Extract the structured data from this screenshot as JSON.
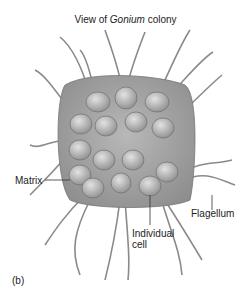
{
  "title": {
    "prefix": "View of ",
    "italic": "Gonium",
    "suffix": " colony"
  },
  "labels": {
    "matrix": "Matrix",
    "flagellum": "Flagellum",
    "cell_line1": "Individual",
    "cell_line2": "cell",
    "panel": "(b)"
  },
  "colors": {
    "matrix": "#9a9a9a",
    "cell": "#b0b0b0",
    "flagellum": "#8a8a8a"
  }
}
